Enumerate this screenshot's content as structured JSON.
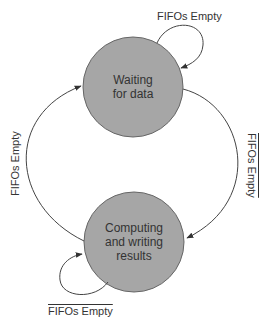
{
  "diagram": {
    "type": "state-machine",
    "colors": {
      "state_fill": "#a6a6a6",
      "state_stroke": "#666666",
      "edge": "#444444",
      "text": "#333333",
      "background": "#ffffff"
    },
    "states": [
      {
        "id": "waiting",
        "line1": "Waiting",
        "line2": "for data",
        "line3": ""
      },
      {
        "id": "computing",
        "line1": "Computing",
        "line2": "and writing",
        "line3": "results"
      }
    ],
    "transitions": [
      {
        "from": "waiting",
        "to": "waiting",
        "label": "FIFOs Empty",
        "negated": false
      },
      {
        "from": "waiting",
        "to": "computing",
        "label": "FIFOs Empty",
        "negated": true
      },
      {
        "from": "computing",
        "to": "computing",
        "label": "FIFOs Empty",
        "negated": true
      },
      {
        "from": "computing",
        "to": "waiting",
        "label": "FIFOs Empty",
        "negated": false
      }
    ]
  }
}
